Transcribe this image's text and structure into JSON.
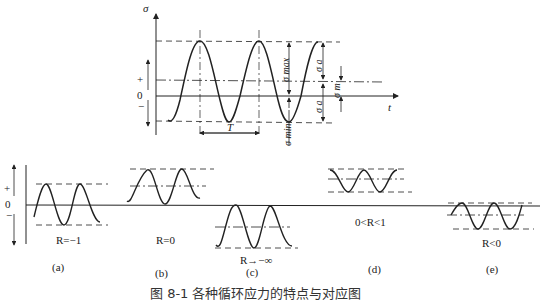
{
  "top_diagram": {
    "y_axis_label": "σ",
    "x_axis_label": "t",
    "sign_plus": "+",
    "sign_zero": "0",
    "sign_minus": "−",
    "period_label": "T",
    "sigma_max": "σ max",
    "sigma_min": "σ min",
    "sigma_a_upper": "σ a",
    "sigma_a_lower": "σ a",
    "sigma_m": "σ m"
  },
  "bottom_axis": {
    "sign_plus": "+",
    "sign_zero": "0",
    "sign_minus": "−"
  },
  "cases": [
    {
      "id": "a",
      "label": "(a)",
      "ratio": "R=−1"
    },
    {
      "id": "b",
      "label": "(b)",
      "ratio": "R=0"
    },
    {
      "id": "c",
      "label": "(c)",
      "ratio": "R→−∞"
    },
    {
      "id": "d",
      "label": "(d)",
      "ratio": "0<R<1"
    },
    {
      "id": "e",
      "label": "(e)",
      "ratio": "R<0"
    }
  ],
  "caption": "图 8-1  各种循环应力的特点与对应图"
}
